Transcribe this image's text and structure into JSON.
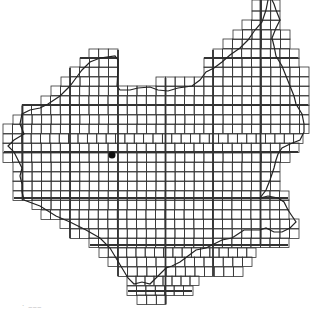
{
  "map": {
    "type": "grid-coverage-map",
    "colors": {
      "background": "#ffffff",
      "grid": "#333333",
      "boundary": "#222222",
      "marker": "#111111"
    },
    "grid": {
      "origin_x": 3.5,
      "origin_y": 1.5,
      "cell": 9.47,
      "major_every": 5,
      "major_x_lines": [
        22.5,
        70,
        118,
        165.5,
        213,
        260.5
      ],
      "major_y_lines": [
        58,
        105,
        152,
        198,
        245,
        291
      ]
    },
    "rows": [
      {
        "y": 0,
        "h": 11,
        "l": 252,
        "r": 280
      },
      {
        "y": 11,
        "l": 252,
        "r": 280
      },
      {
        "y": 20,
        "l": 242,
        "r": 280
      },
      {
        "y": 30,
        "l": 233,
        "r": 290
      },
      {
        "y": 39,
        "l": 223,
        "r": 290
      },
      {
        "y": 49,
        "l": 89,
        "r": 118
      },
      {
        "y": 49,
        "l": 213,
        "r": 299
      },
      {
        "y": 58,
        "l": 80,
        "r": 118
      },
      {
        "y": 58,
        "l": 204,
        "r": 299
      },
      {
        "y": 67,
        "l": 70,
        "r": 118
      },
      {
        "y": 67,
        "l": 204,
        "r": 309
      },
      {
        "y": 77,
        "l": 61,
        "r": 118
      },
      {
        "y": 77,
        "l": 156,
        "r": 309
      },
      {
        "y": 86,
        "l": 51,
        "r": 309
      },
      {
        "y": 96,
        "l": 41,
        "r": 309
      },
      {
        "y": 105,
        "l": 22,
        "r": 309
      },
      {
        "y": 115,
        "l": 13,
        "r": 309
      },
      {
        "y": 124,
        "l": 3,
        "r": 309
      },
      {
        "y": 134,
        "l": 3,
        "r": 303
      },
      {
        "y": 143,
        "l": 3,
        "r": 299
      },
      {
        "y": 153,
        "l": 3,
        "r": 290
      },
      {
        "y": 162,
        "l": 13,
        "r": 280
      },
      {
        "y": 172,
        "l": 13,
        "r": 280
      },
      {
        "y": 181,
        "l": 13,
        "r": 280
      },
      {
        "y": 191,
        "l": 13,
        "r": 289
      },
      {
        "y": 200,
        "l": 32,
        "r": 289
      },
      {
        "y": 210,
        "l": 41,
        "r": 289
      },
      {
        "y": 219,
        "l": 60,
        "r": 299
      },
      {
        "y": 229,
        "l": 70,
        "r": 299
      },
      {
        "y": 238,
        "l": 89,
        "r": 289
      },
      {
        "y": 248,
        "l": 99,
        "r": 256
      },
      {
        "y": 257,
        "l": 108,
        "r": 252
      },
      {
        "y": 267,
        "l": 118,
        "r": 243
      },
      {
        "y": 276,
        "l": 127,
        "r": 199
      },
      {
        "y": 286,
        "l": 127,
        "r": 193
      },
      {
        "y": 295,
        "l": 137,
        "r": 166
      }
    ],
    "boundary_path": "M268,0 L266,10 L262,22 L255,30 L248,40 L240,48 L230,55 L222,62 L214,68 L206,72 L200,80 L192,86 L178,88 L168,91 L158,90 L150,87 L138,88 L130,90 L120,90 L117,86 L118,70 L118,60 L115,56 L100,58 L90,62 L82,70 L76,78 L70,86 L60,96 L48,104 L40,108 L30,110 L22,114 L20,124 L24,134 L14,140 L8,146 L14,152 L18,160 L22,168 L20,176 L22,184 L22,192 L24,200 L40,206 L56,216 L70,222 L86,230 L100,238 L110,248 L116,258 L122,268 L128,278 L134,284 L142,282 L150,284 L158,276 L166,268 L172,266 L180,262 L188,256 L196,250 L206,248 L214,244 L222,240 L232,238 L238,234 L244,230 L250,230 L260,230 L266,228 L274,232 L282,232 L290,228 L296,222 L292,216 L288,210 L284,202 L278,198 L268,196 L260,198 L266,190 L270,180 L274,168 L276,160 L278,154 L282,148 L290,144 L300,140 L304,132 L304,124 L302,114 L296,104 L294,96 L290,86 L286,76 L282,66 L276,56 L274,46 L272,38 L276,28 L280,20 L276,10 L274,4 L272,0",
    "marker": {
      "label": "site-marker",
      "cx": 112,
      "cy": 155,
      "r": 3.5
    },
    "caption_marks": ". ___"
  }
}
